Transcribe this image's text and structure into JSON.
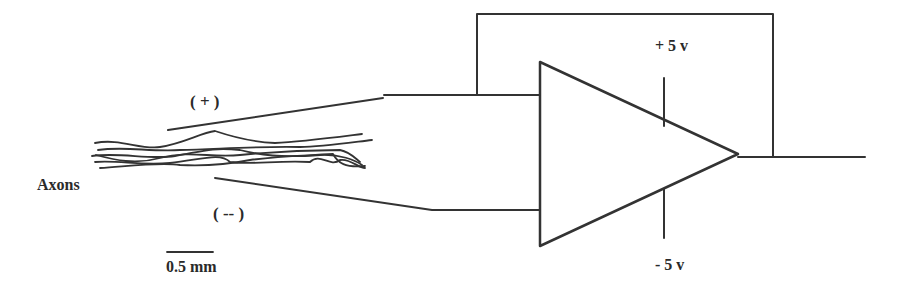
{
  "diagram": {
    "labels": {
      "plus_electrode": "( + )",
      "minus_electrode": "( -- )",
      "axons": "Axons",
      "scale_bar": "0.5 mm",
      "pos_supply": "+ 5 v",
      "neg_supply": "- 5 v"
    },
    "components": [
      "axon-bundle",
      "positive-electrode",
      "negative-electrode",
      "op-amp",
      "feedback-loop",
      "output-line",
      "scale-bar"
    ],
    "colors": {
      "stroke": "#333333",
      "text": "#2a2a2a",
      "background": "#ffffff"
    }
  }
}
